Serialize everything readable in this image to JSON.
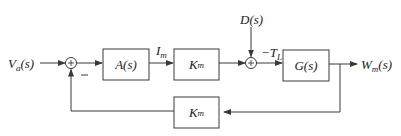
{
  "diagram": {
    "type": "block-diagram",
    "colors": {
      "line": "#3a3a3a",
      "text": "#222222",
      "background": "#ffffff"
    },
    "input": {
      "label": "V",
      "sub": "a",
      "suffix": "(s)"
    },
    "output": {
      "label": "W",
      "sub": "m",
      "suffix": "(s)"
    },
    "disturbance": {
      "label": "D(s)"
    },
    "blocks": {
      "amplifier": {
        "label": "A(s)"
      },
      "torque_constant": {
        "label": "K",
        "sub": "m"
      },
      "plant": {
        "label": "G(s)"
      },
      "feedback": {
        "label": "K",
        "sub": "m"
      }
    },
    "signals": {
      "current": {
        "label": "I",
        "sub": "m"
      },
      "load_torque": {
        "label": "−T",
        "sub": "L"
      }
    },
    "summing_junctions": [
      {
        "id": "sum1",
        "symbol": "+",
        "negative_input_sign": "−"
      },
      {
        "id": "sum2",
        "symbol": "+"
      }
    ]
  }
}
